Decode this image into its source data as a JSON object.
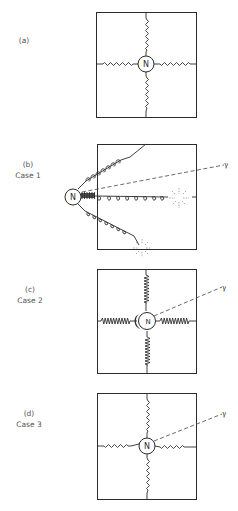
{
  "figure": {
    "panels": [
      {
        "id": "a",
        "label": "(a)",
        "case": "",
        "nucleus": "N",
        "has_gamma": false
      },
      {
        "id": "b",
        "label": "(b)",
        "case": "Case 1",
        "nucleus": "N",
        "has_gamma": true,
        "gamma": "γ"
      },
      {
        "id": "c",
        "label": "(c)",
        "case": "Case 2",
        "nucleus": "N",
        "has_gamma": true,
        "gamma": "γ"
      },
      {
        "id": "d",
        "label": "(d)",
        "case": "Case 3",
        "nucleus": "N",
        "has_gamma": true,
        "gamma": "γ"
      }
    ]
  }
}
